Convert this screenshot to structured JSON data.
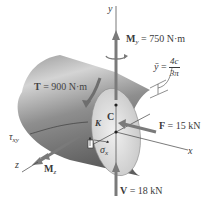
{
  "figure": {
    "type": "mechanics-free-body-diagram",
    "colors": {
      "shaft_dark": "#6e6e6e",
      "shaft_light": "#d8d8d8",
      "face": "#e6e6e6",
      "arrow": "#7a7a7a",
      "line": "#3a3a3a",
      "text": "#3a3a3a"
    }
  },
  "axes": {
    "x": "x",
    "y": "y",
    "z": "z"
  },
  "loads": {
    "My": {
      "symbol": "M",
      "sub": "y",
      "eq": " = 750 N·m"
    },
    "T": {
      "symbol": "T",
      "eq": " = 900 N·m"
    },
    "F": {
      "symbol": "F",
      "eq": " = 15 kN"
    },
    "V": {
      "symbol": "V",
      "eq": " = 18 kN"
    },
    "Mz": {
      "symbol": "M",
      "sub": "z"
    }
  },
  "points": {
    "C": "C",
    "K": "K"
  },
  "stresses": {
    "tau": {
      "symbol": "τ",
      "sub": "xy"
    },
    "sigma": {
      "symbol": "σ",
      "sub": "x"
    }
  },
  "centroid": {
    "lhs": "ȳ",
    "eq": " = ",
    "num": "4c",
    "den": "3π"
  }
}
